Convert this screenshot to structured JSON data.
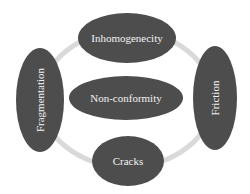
{
  "diagram": {
    "type": "cycle-with-center",
    "colors": {
      "node_fill": "#4d4d4d",
      "ring_stroke": "#d9d9d9",
      "text": "#f2f2f2",
      "background": "#ffffff"
    },
    "center": {
      "label": "Non-conformity"
    },
    "nodes": [
      {
        "id": "top",
        "label": "Inhomogenecity",
        "orientation": "horizontal"
      },
      {
        "id": "right",
        "label": "Friction",
        "orientation": "vertical"
      },
      {
        "id": "bottom",
        "label": "Cracks",
        "orientation": "horizontal"
      },
      {
        "id": "left",
        "label": "Fragmentation",
        "orientation": "vertical"
      }
    ]
  }
}
